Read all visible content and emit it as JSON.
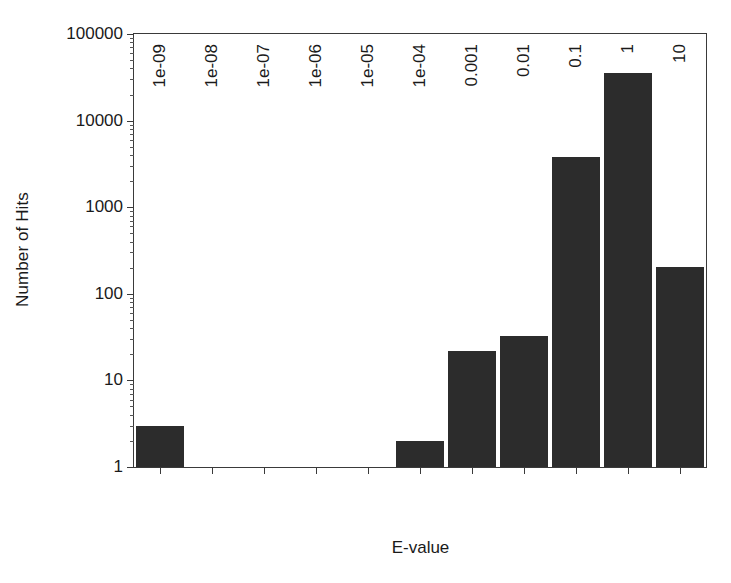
{
  "chart_data": {
    "type": "bar",
    "title": "",
    "xlabel": "E-value",
    "ylabel": "Number of Hits",
    "categories": [
      "1e-09",
      "1e-08",
      "1e-07",
      "1e-06",
      "1e-05",
      "1e-04",
      "0.001",
      "0.01",
      "0.1",
      "1",
      "10"
    ],
    "values": [
      3,
      0,
      0,
      0,
      0,
      2,
      22,
      33,
      3800,
      35000,
      205
    ],
    "yscale": "log",
    "ylim": [
      1,
      100000
    ],
    "ytick_labels": [
      "1",
      "10",
      "100",
      "1000",
      "10000",
      "100000"
    ],
    "ytick_values": [
      1,
      10,
      100,
      1000,
      10000,
      100000
    ],
    "grid": false,
    "legend": null,
    "bar_color": "#2c2c2c",
    "frame_color": "#3a3a3a",
    "background": "#ffffff"
  },
  "axes": {
    "y_title": "Number of Hits",
    "x_title": "E-value"
  }
}
